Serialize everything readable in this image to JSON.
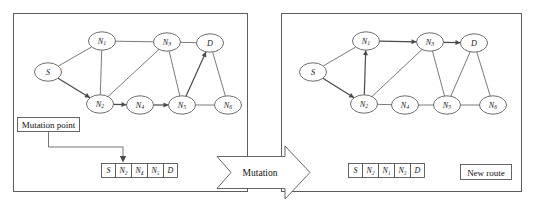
{
  "figure": {
    "caption": ""
  },
  "panels": {
    "left": {
      "name": "original-route-panel",
      "annotation_box": {
        "label": "Mutation point"
      },
      "chromosome": {
        "name": "original-chromosome",
        "cells": [
          "S",
          "N2",
          "N4",
          "N5",
          "D"
        ],
        "cells_display": [
          "S",
          "N₂",
          "N₄",
          "N₅",
          "D"
        ],
        "mutation_index": 1
      },
      "graph": {
        "nodes": [
          {
            "id": "S",
            "label": "S",
            "base": "S",
            "sub": "",
            "x": 48,
            "y": 72
          },
          {
            "id": "N1",
            "label": "N1",
            "base": "N",
            "sub": "1",
            "x": 102,
            "y": 41
          },
          {
            "id": "N2",
            "label": "N2",
            "base": "N",
            "sub": "2",
            "x": 100,
            "y": 104
          },
          {
            "id": "N3",
            "label": "N3",
            "base": "N",
            "sub": "3",
            "x": 167,
            "y": 42
          },
          {
            "id": "N4",
            "label": "N4",
            "base": "N",
            "sub": "4",
            "x": 140,
            "y": 105
          },
          {
            "id": "N5",
            "label": "N5",
            "base": "N",
            "sub": "5",
            "x": 182,
            "y": 105
          },
          {
            "id": "N6",
            "label": "N6",
            "base": "N",
            "sub": "6",
            "x": 228,
            "y": 105
          },
          {
            "id": "D",
            "label": "D",
            "base": "D",
            "sub": "",
            "x": 210,
            "y": 43
          }
        ],
        "edges": [
          {
            "from": "S",
            "to": "N1",
            "directed": false
          },
          {
            "from": "S",
            "to": "N2",
            "directed": true
          },
          {
            "from": "N1",
            "to": "N2",
            "directed": false
          },
          {
            "from": "N1",
            "to": "N3",
            "directed": false
          },
          {
            "from": "N2",
            "to": "N3",
            "directed": false
          },
          {
            "from": "N2",
            "to": "N4",
            "directed": true
          },
          {
            "from": "N4",
            "to": "N5",
            "directed": true
          },
          {
            "from": "N3",
            "to": "D",
            "directed": false
          },
          {
            "from": "N3",
            "to": "N5",
            "directed": false
          },
          {
            "from": "N5",
            "to": "D",
            "directed": true
          },
          {
            "from": "N5",
            "to": "N6",
            "directed": false
          },
          {
            "from": "N6",
            "to": "D",
            "directed": false
          }
        ],
        "highlighted_path": [
          "S",
          "N2",
          "N4",
          "N5",
          "D"
        ]
      }
    },
    "right": {
      "name": "new-route-panel",
      "annotation_box": {
        "label": "New route"
      },
      "chromosome": {
        "name": "mutated-chromosome",
        "cells": [
          "S",
          "N2",
          "N1",
          "N3",
          "D"
        ],
        "cells_display": [
          "S",
          "N₂",
          "N₁",
          "N₃",
          "D"
        ]
      },
      "graph": {
        "nodes": [
          {
            "id": "S",
            "label": "S",
            "base": "S",
            "sub": "",
            "x": 313,
            "y": 72
          },
          {
            "id": "N1",
            "label": "N1",
            "base": "N",
            "sub": "1",
            "x": 366,
            "y": 41
          },
          {
            "id": "N2",
            "label": "N2",
            "base": "N",
            "sub": "2",
            "x": 364,
            "y": 104
          },
          {
            "id": "N3",
            "label": "N3",
            "base": "N",
            "sub": "3",
            "x": 430,
            "y": 42
          },
          {
            "id": "N4",
            "label": "N4",
            "base": "N",
            "sub": "4",
            "x": 405,
            "y": 105
          },
          {
            "id": "N5",
            "label": "N5",
            "base": "N",
            "sub": "5",
            "x": 447,
            "y": 105
          },
          {
            "id": "N6",
            "label": "N6",
            "base": "N",
            "sub": "6",
            "x": 493,
            "y": 105
          },
          {
            "id": "D",
            "label": "D",
            "base": "D",
            "sub": "",
            "x": 474,
            "y": 43
          }
        ],
        "edges": [
          {
            "from": "S",
            "to": "N1",
            "directed": false
          },
          {
            "from": "S",
            "to": "N2",
            "directed": true
          },
          {
            "from": "N2",
            "to": "N1",
            "directed": true
          },
          {
            "from": "N1",
            "to": "N3",
            "directed": true
          },
          {
            "from": "N2",
            "to": "N3",
            "directed": false
          },
          {
            "from": "N2",
            "to": "N4",
            "directed": false
          },
          {
            "from": "N4",
            "to": "N5",
            "directed": false
          },
          {
            "from": "N3",
            "to": "D",
            "directed": true
          },
          {
            "from": "N3",
            "to": "N5",
            "directed": false
          },
          {
            "from": "N5",
            "to": "D",
            "directed": false
          },
          {
            "from": "N5",
            "to": "N6",
            "directed": false
          },
          {
            "from": "N6",
            "to": "D",
            "directed": false
          }
        ],
        "highlighted_path": [
          "S",
          "N2",
          "N1",
          "N3",
          "D"
        ]
      }
    }
  },
  "transform_arrow": {
    "name": "mutation-arrow",
    "label": "Mutation"
  },
  "colors": {
    "stroke": "#5d5d5d",
    "edge": "#6b6b6b",
    "text": "#111111",
    "background": "#ffffff"
  }
}
